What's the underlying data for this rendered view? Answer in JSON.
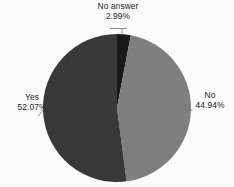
{
  "chart_data": {
    "type": "pie",
    "title": "",
    "subtitle": "",
    "xlabel": "",
    "ylabel": "",
    "legend_position": "none",
    "grid": false,
    "labels_outside": true,
    "start_angle_deg": 0,
    "direction": "clockwise",
    "categories": [
      "No answer",
      "No",
      "Yes"
    ],
    "values": [
      2.99,
      44.94,
      52.07
    ],
    "units": "percent",
    "slices": [
      {
        "label": "No answer",
        "value": 2.99,
        "value_text": "2.99%",
        "color": "#1a1a1a",
        "leader": true
      },
      {
        "label": "No",
        "value": 44.94,
        "value_text": "44.94%",
        "color": "#808080",
        "leader": true
      },
      {
        "label": "Yes",
        "value": 52.07,
        "value_text": "52.07%",
        "color": "#3a3a3a",
        "leader": true
      }
    ],
    "colors": {
      "no_answer": "#1a1a1a",
      "no": "#808080",
      "yes": "#3a3a3a",
      "background": "#fdfdfd",
      "text": "#1c1c1c",
      "leader_line": "#6e6e6e"
    }
  },
  "labels": {
    "no_answer": {
      "name": "No answer",
      "value": "2.99%"
    },
    "no": {
      "name": "No",
      "value": "44.94%"
    },
    "yes": {
      "name": "Yes",
      "value": "52.07%"
    }
  }
}
